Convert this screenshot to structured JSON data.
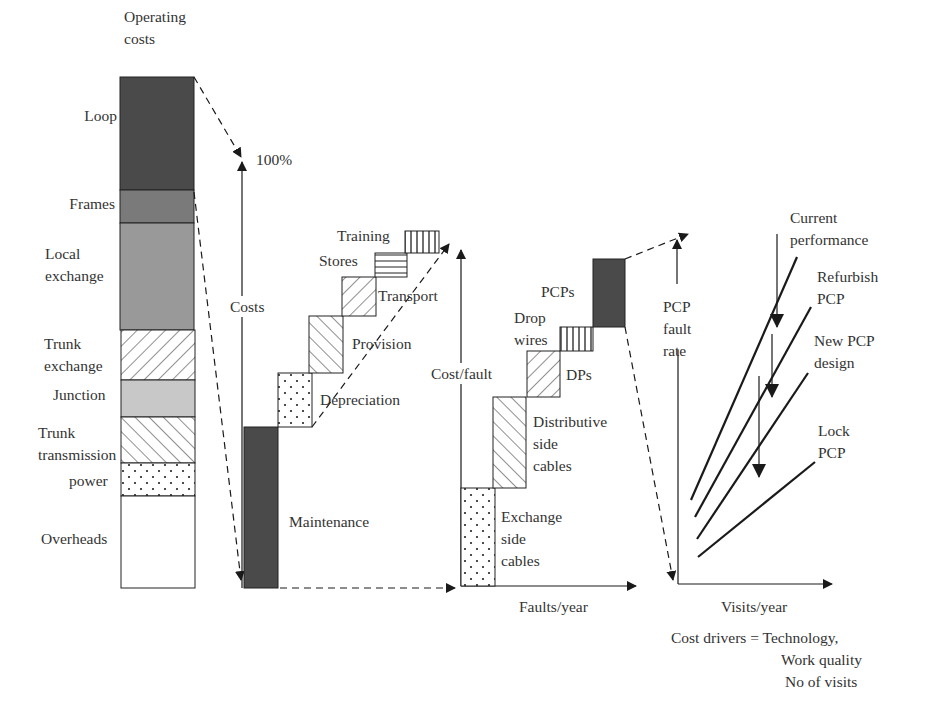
{
  "colors": {
    "ink": "#1a1a1a",
    "dark_fill": "#4a4a4a",
    "mid_fill": "#7a7a7a",
    "light_mid_fill": "#999999",
    "light_fill": "#c8c8c8",
    "text": "#333333"
  },
  "operating_costs": {
    "title_line1": "Operating",
    "title_line2": "costs",
    "segments": [
      {
        "label": "Loop",
        "pattern": "dark"
      },
      {
        "label": "Frames",
        "pattern": "mid"
      },
      {
        "label_line1": "Local",
        "label_line2": "exchange",
        "pattern": "light-mid"
      },
      {
        "label_line1": "Trunk",
        "label_line2": "exchange",
        "pattern": "diagonal-forward"
      },
      {
        "label": "Junction",
        "pattern": "light"
      },
      {
        "label_line1": "Trunk",
        "label_line2": "transmission",
        "pattern": "diagonal-back"
      },
      {
        "label": "power",
        "pattern": "dots"
      },
      {
        "label": "Overheads",
        "pattern": "blank"
      }
    ]
  },
  "loop_costs": {
    "axis_label": "Costs",
    "top_label": "100%",
    "steps": [
      {
        "label": "Maintenance",
        "pattern": "dark"
      },
      {
        "label": "Depreciation",
        "pattern": "dots"
      },
      {
        "label": "Provision",
        "pattern": "diagonal-back"
      },
      {
        "label": "Transport",
        "pattern": "diagonal-forward"
      },
      {
        "label": "Stores",
        "pattern": "horizontal"
      },
      {
        "label": "Training",
        "pattern": "vertical"
      }
    ]
  },
  "maintenance_breakdown": {
    "y_axis_label": "Cost/fault",
    "x_axis_label": "Faults/year",
    "steps": [
      {
        "label_line1": "Exchange",
        "label_line2": "side",
        "label_line3": "cables",
        "pattern": "dots"
      },
      {
        "label_line1": "Distributive",
        "label_line2": "side",
        "label_line3": "cables",
        "pattern": "diagonal-back"
      },
      {
        "label": "DPs",
        "pattern": "diagonal-forward"
      },
      {
        "label_line1": "Drop",
        "label_line2": "wires",
        "pattern": "vertical"
      },
      {
        "label": "PCPs",
        "pattern": "dark"
      }
    ]
  },
  "pcp_chart": {
    "y_axis_label_line1": "PCP",
    "y_axis_label_line2": "fault",
    "y_axis_label_line3": "rate",
    "x_axis_label": "Visits/year",
    "lines": [
      {
        "label_line1": "Current",
        "label_line2": "performance"
      },
      {
        "label_line1": "Refurbish",
        "label_line2": "PCP"
      },
      {
        "label_line1": "New PCP",
        "label_line2": "design"
      },
      {
        "label_line1": "Lock",
        "label_line2": "PCP"
      }
    ],
    "cost_drivers": {
      "prefix": "Cost drivers = Technology,",
      "line2": "Work quality",
      "line3": "No of visits"
    }
  }
}
